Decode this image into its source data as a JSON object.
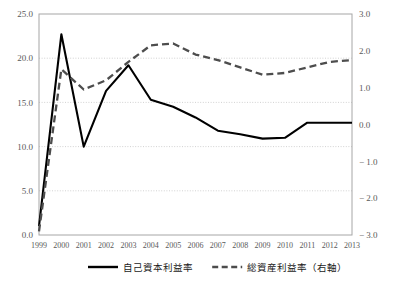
{
  "chart_data": {
    "type": "line",
    "title": "",
    "xlabel": "",
    "ylabel": "",
    "grid": true,
    "legend_position": "bottom",
    "categories": [
      "1999",
      "2000",
      "2001",
      "2002",
      "2003",
      "2004",
      "2005",
      "2006",
      "2007",
      "2008",
      "2009",
      "2010",
      "2011",
      "2012",
      "2013"
    ],
    "left_axis": {
      "ylim": [
        0.0,
        25.0
      ],
      "ticks": [
        "0.0",
        "5.0",
        "10.0",
        "15.0",
        "20.0",
        "25.0"
      ],
      "tick_values": [
        0.0,
        5.0,
        10.0,
        15.0,
        20.0,
        25.0
      ]
    },
    "right_axis": {
      "ylim": [
        -3.0,
        3.0
      ],
      "ticks": [
        "-3.0",
        "-2.0",
        "-1.0",
        "0.0",
        "1.0",
        "2.0",
        "3.0"
      ],
      "tick_values": [
        -3.0,
        -2.0,
        -1.0,
        0.0,
        1.0,
        2.0,
        3.0
      ]
    },
    "series": [
      {
        "name": "自己資本利益率",
        "axis": "left",
        "style": "solid",
        "color": "#000000",
        "values": [
          1.0,
          22.7,
          10.0,
          16.3,
          19.2,
          15.3,
          14.5,
          13.3,
          11.8,
          11.4,
          10.9,
          11.0,
          12.7,
          12.7,
          12.7
        ]
      },
      {
        "name": "総資産利益率（右軸）",
        "axis": "right",
        "style": "dashed",
        "color": "#4d4d4d",
        "values": [
          -2.9,
          1.5,
          0.95,
          1.2,
          1.7,
          2.15,
          2.2,
          1.9,
          1.75,
          1.55,
          1.35,
          1.4,
          1.55,
          1.7,
          1.75
        ]
      }
    ],
    "legend": [
      {
        "label": "自己資本利益率",
        "style": "solid"
      },
      {
        "label": "総資産利益率（右軸）",
        "style": "dashed"
      }
    ]
  }
}
